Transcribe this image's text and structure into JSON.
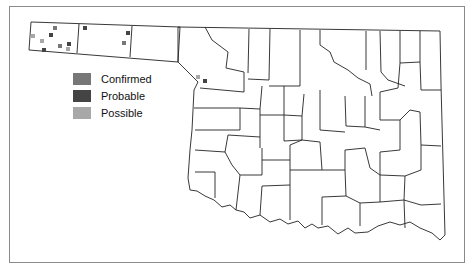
{
  "map": {
    "region": "Oklahoma counties",
    "border_color": "#222222",
    "frame_color": "#8a8a8a"
  },
  "legend": {
    "items": [
      {
        "label": "Confirmed",
        "color": "#777777"
      },
      {
        "label": "Probable",
        "color": "#444444"
      },
      {
        "label": "Possible",
        "color": "#a8a8a8"
      }
    ]
  },
  "markers": [
    {
      "x": 55,
      "y": 28,
      "type": "Confirmed"
    },
    {
      "x": 51,
      "y": 35,
      "type": "Probable"
    },
    {
      "x": 42,
      "y": 41,
      "type": "Possible"
    },
    {
      "x": 60,
      "y": 46,
      "type": "Confirmed"
    },
    {
      "x": 69,
      "y": 44,
      "type": "Probable"
    },
    {
      "x": 68,
      "y": 49,
      "type": "Possible"
    },
    {
      "x": 44,
      "y": 50,
      "type": "Probable"
    },
    {
      "x": 33,
      "y": 36,
      "type": "Possible"
    },
    {
      "x": 85,
      "y": 28,
      "type": "Probable"
    },
    {
      "x": 128,
      "y": 33,
      "type": "Probable"
    },
    {
      "x": 124,
      "y": 43,
      "type": "Confirmed"
    },
    {
      "x": 198,
      "y": 77,
      "type": "Possible"
    },
    {
      "x": 205,
      "y": 81,
      "type": "Probable"
    }
  ]
}
